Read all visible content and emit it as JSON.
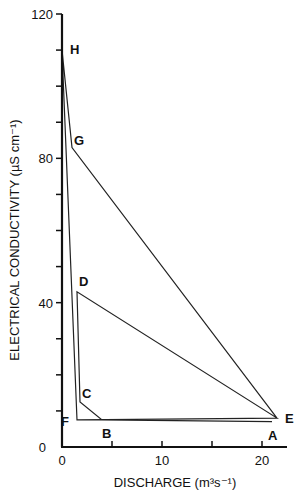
{
  "chart_data": {
    "type": "line",
    "title": "",
    "xlabel": "DISCHARGE (m³s⁻¹)",
    "ylabel": "ELECTRICAL CONDUCTIVITY (µS cm⁻¹)",
    "xlim": [
      0,
      22.5
    ],
    "ylim": [
      0,
      120
    ],
    "x_ticks": [
      0,
      5,
      10,
      15,
      20
    ],
    "x_tick_labels": [
      "0",
      "",
      "10",
      "",
      "20"
    ],
    "y_ticks": [
      0,
      10,
      20,
      30,
      40,
      50,
      60,
      70,
      80,
      90,
      100,
      110,
      120
    ],
    "y_tick_labels": [
      "0",
      "",
      "",
      "",
      "40",
      "",
      "",
      "",
      "80",
      "",
      "",
      "",
      "120"
    ],
    "grid": false,
    "legend": null,
    "series": [
      {
        "name": "hysteresis loop",
        "points": [
          {
            "label": "A",
            "x": 21.0,
            "y": 7.0
          },
          {
            "label": "B",
            "x": 4.0,
            "y": 7.5
          },
          {
            "label": "C",
            "x": 1.8,
            "y": 12.5
          },
          {
            "label": "D",
            "x": 1.5,
            "y": 43.0
          },
          {
            "label": "E",
            "x": 21.5,
            "y": 8.0
          },
          {
            "label": "F",
            "x": 1.5,
            "y": 7.5
          },
          {
            "label": "H",
            "x": 0.0,
            "y": 110.0
          },
          {
            "label": "G",
            "x": 1.0,
            "y": 83.0
          },
          {
            "label": "E",
            "x": 21.5,
            "y": 8.0
          }
        ]
      }
    ],
    "annotations": [
      "A",
      "B",
      "C",
      "D",
      "E",
      "F",
      "G",
      "H"
    ]
  }
}
